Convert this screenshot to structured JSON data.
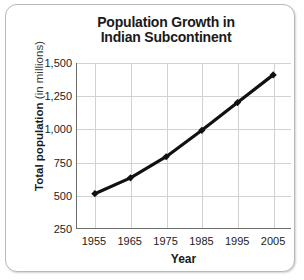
{
  "chart_data": {
    "type": "line",
    "title": "Population Growth in Indian Subcontinent",
    "title_lines": [
      "Population Growth in",
      "Indian Subcontinent"
    ],
    "xlabel": "Year",
    "ylabel": "Total population (in millions)",
    "ylabel_main": "Total population ",
    "ylabel_sub": "(in millions)",
    "x": [
      1955,
      1965,
      1975,
      1985,
      1995,
      2005
    ],
    "categories": [
      "1955",
      "1965",
      "1975",
      "1985",
      "1995",
      "2005"
    ],
    "values": [
      510,
      630,
      790,
      990,
      1200,
      1410
    ],
    "series": [
      {
        "name": "Total population",
        "values": [
          510,
          630,
          790,
          990,
          1200,
          1410
        ]
      }
    ],
    "xlim": [
      1950,
      2010
    ],
    "ylim": [
      250,
      1500
    ],
    "ytick_labels": [
      "1,500",
      "1,250",
      "1,000",
      "750",
      "500",
      "250"
    ],
    "ytick_values": [
      1500,
      1250,
      1000,
      750,
      500,
      250
    ],
    "xtick_labels": [
      "1955",
      "1965",
      "1975",
      "1985",
      "1995",
      "2005"
    ],
    "grid": true,
    "legend": "none",
    "marker": "diamond",
    "line_color": "#111111",
    "grid_color": "#d2d2d2",
    "axis_color": "#6d6d6d",
    "frame_color": "#b9b9b9",
    "background_color": "#ffffff"
  }
}
